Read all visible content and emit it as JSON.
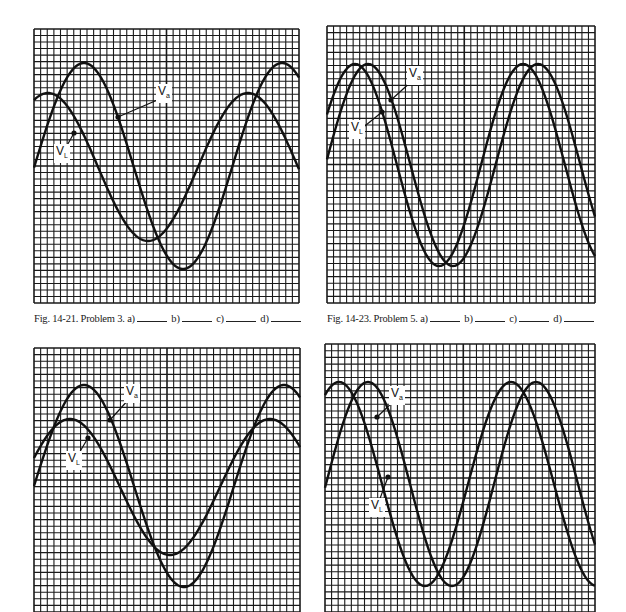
{
  "chart_data": [
    {
      "type": "line",
      "title": "Fig. 14-21",
      "caption": "Fig. 14-21. Problem 3.",
      "answer_slots": [
        "a)",
        "b)",
        "c)",
        "d)"
      ],
      "grid": {
        "on": true,
        "cells_x": 40,
        "cells_y": 42
      },
      "xlabel": "",
      "ylabel": "",
      "series": [
        {
          "name": "Va",
          "amplitude_px": 103,
          "period_px": 198,
          "peak_x_px": 50,
          "center_y_px": 137
        },
        {
          "name": "VL",
          "amplitude_px": 74,
          "period_px": 200,
          "peak_x_px": 14,
          "center_y_px": 138
        }
      ]
    },
    {
      "type": "line",
      "title": "Fig. 14-23",
      "caption": "Fig. 14-23. Problem 5.",
      "answer_slots": [
        "a)",
        "b)",
        "c)",
        "d)"
      ],
      "grid": {
        "on": true,
        "cells_x": 41,
        "cells_y": 42
      },
      "xlabel": "",
      "ylabel": "",
      "series": [
        {
          "name": "Va",
          "amplitude_px": 101,
          "period_px": 170,
          "peak_x_px": 41,
          "center_y_px": 139
        },
        {
          "name": "VL",
          "amplitude_px": 101,
          "period_px": 168,
          "peak_x_px": 28,
          "center_y_px": 139
        }
      ]
    },
    {
      "type": "line",
      "title": "Fig. 14-22",
      "caption": "",
      "grid": {
        "on": true,
        "cells_x": 40,
        "cells_y": 40
      },
      "xlabel": "",
      "ylabel": "",
      "series": [
        {
          "name": "Va",
          "amplitude_px": 101,
          "period_px": 200,
          "peak_x_px": 50,
          "center_y_px": 138
        },
        {
          "name": "VL",
          "amplitude_px": 68,
          "period_px": 200,
          "peak_x_px": 36,
          "center_y_px": 139
        }
      ]
    },
    {
      "type": "line",
      "title": "Fig. 14-24",
      "caption": "",
      "grid": {
        "on": true,
        "cells_x": 41,
        "cells_y": 40
      },
      "xlabel": "",
      "ylabel": "",
      "series": [
        {
          "name": "Va",
          "amplitude_px": 102,
          "period_px": 168,
          "peak_x_px": 43,
          "center_y_px": 140
        },
        {
          "name": "VL",
          "amplitude_px": 102,
          "period_px": 172,
          "peak_x_px": 14,
          "center_y_px": 140
        }
      ]
    }
  ],
  "panels": [
    {
      "x": 34,
      "y": 29,
      "w": 265,
      "h": 274,
      "cells_x": 40,
      "cells_y": 42,
      "labels": {
        "va": {
          "x": 122,
          "y": 55,
          "ax": 84,
          "ay": 88
        },
        "vl": {
          "x": 20,
          "y": 115,
          "ax": 40,
          "ay": 104
        }
      },
      "caption": {
        "x": 34,
        "y": 316,
        "text": "Fig. 14-21. Problem 3."
      }
    },
    {
      "x": 327,
      "y": 26,
      "w": 268,
      "h": 277,
      "cells_x": 41,
      "cells_y": 42,
      "labels": {
        "va": {
          "x": 80,
          "y": 40,
          "ax": 64,
          "ay": 74
        },
        "vl": {
          "x": 22,
          "y": 94,
          "ax": 55,
          "ay": 86
        }
      },
      "caption": {
        "x": 327,
        "y": 316,
        "text": "Fig. 14-23. Problem 5."
      }
    },
    {
      "x": 34,
      "y": 348,
      "w": 266,
      "h": 264,
      "cells_x": 40,
      "cells_y": 40,
      "labels": {
        "va": {
          "x": 90,
          "y": 36,
          "ax": 76,
          "ay": 72
        },
        "vl": {
          "x": 32,
          "y": 103,
          "ax": 54,
          "ay": 90
        }
      },
      "caption": null
    },
    {
      "x": 325,
      "y": 344,
      "w": 270,
      "h": 268,
      "cells_x": 41,
      "cells_y": 40,
      "labels": {
        "va": {
          "x": 64,
          "y": 42,
          "ax": 52,
          "ay": 73
        },
        "vl": {
          "x": 44,
          "y": 154,
          "ax": 63,
          "ay": 133
        }
      },
      "caption": null
    }
  ],
  "labels": {
    "va_main": "V",
    "va_sub": "a",
    "vl_main": "V",
    "vl_sub": "L"
  },
  "captions": {
    "fig1": "Fig. 14-21. Problem 3.",
    "fig2": "Fig. 14-23. Problem 5.",
    "slot_a": "a)",
    "slot_b": "b)",
    "slot_c": "c)",
    "slot_d": "d)"
  },
  "colors": {
    "grid": "#1a1a1a",
    "trace": "#111111",
    "paper": "#ffffff"
  }
}
